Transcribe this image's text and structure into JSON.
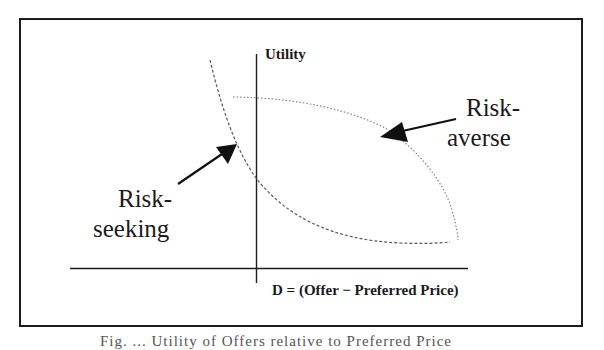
{
  "figure": {
    "y_axis_label": "Utility",
    "x_axis_label": "D = (Offer − Preferred Price)",
    "curves": [
      {
        "name": "Risk-averse",
        "label_line1": "Risk-",
        "label_line2": "averse",
        "style": "dotted",
        "shape": "concave"
      },
      {
        "name": "Risk-seeking",
        "label_line1": "Risk-",
        "label_line2": "seeking",
        "style": "dashed",
        "shape": "convex"
      }
    ],
    "caption_clipped": "Fig. ... Utility of Offers relative to Preferred Price"
  },
  "colors": {
    "line": "#1c1c1c",
    "curve": "#6a6a6a",
    "background": "#ffffff"
  }
}
